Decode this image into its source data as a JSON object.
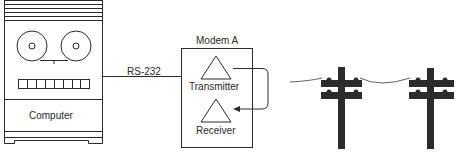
{
  "diagram": {
    "computer": {
      "label": "Computer"
    },
    "link": {
      "label": "RS-232"
    },
    "modem": {
      "title": "Modem A",
      "transmitter": "Transmitter",
      "receiver": "Receiver"
    },
    "telephone_line": {
      "poles": 2
    }
  },
  "colors": {
    "stroke": "#2a2a2a",
    "pole": "#2b2b2b",
    "background": "#ffffff"
  }
}
